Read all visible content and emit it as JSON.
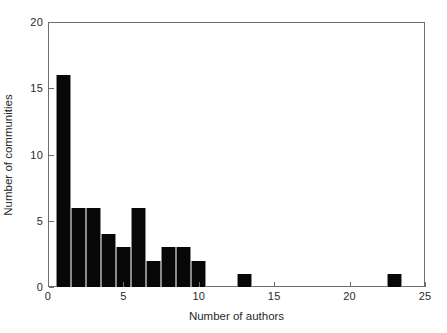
{
  "chart_data": {
    "type": "bar",
    "title": "",
    "xlabel": "Number of authors",
    "ylabel": "Number of communities",
    "xlim": [
      0,
      25
    ],
    "ylim": [
      0,
      20
    ],
    "grid": false,
    "legend": null,
    "bar_width": 1,
    "x_ticks": [
      0,
      5,
      10,
      15,
      20,
      25
    ],
    "y_ticks": [
      0,
      5,
      10,
      15,
      20
    ],
    "x_tick_labels": [
      "0",
      "5",
      "10",
      "15",
      "20",
      "25"
    ],
    "y_tick_labels": [
      "0",
      "5",
      "10",
      "15",
      "20"
    ],
    "categories": [
      1,
      2,
      3,
      4,
      5,
      6,
      7,
      8,
      9,
      10,
      13,
      23
    ],
    "values": [
      16,
      6,
      6,
      4,
      3,
      6,
      2,
      3,
      3,
      2,
      1,
      1
    ],
    "bars": [
      {
        "x": 1,
        "y": 16
      },
      {
        "x": 2,
        "y": 6
      },
      {
        "x": 3,
        "y": 6
      },
      {
        "x": 4,
        "y": 4
      },
      {
        "x": 5,
        "y": 3
      },
      {
        "x": 6,
        "y": 6
      },
      {
        "x": 7,
        "y": 2
      },
      {
        "x": 8,
        "y": 3
      },
      {
        "x": 9,
        "y": 3
      },
      {
        "x": 10,
        "y": 2
      },
      {
        "x": 13,
        "y": 1
      },
      {
        "x": 23,
        "y": 1
      }
    ],
    "colors": {
      "bar_fill": "#070707",
      "bar_edge": "#8a8a8a",
      "axis": "#6e6e6e",
      "text": "#2a2a2a",
      "background": "#ffffff"
    }
  }
}
